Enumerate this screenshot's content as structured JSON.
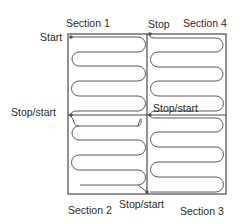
{
  "colors": {
    "outline": "#4a4a4a",
    "cable": "#5a5a5a",
    "dot": "#555555",
    "text": "#2b2b2b",
    "background": "#ffffff"
  },
  "labels": {
    "section1": "Section 1",
    "section2": "Section 2",
    "section3": "Section 3",
    "section4": "Section 4",
    "start": "Start",
    "stop": "Stop",
    "stop_start_left": "Stop/start",
    "stop_start_center": "Stop/start",
    "stop_start_bottom": "Stop/start"
  },
  "markers": [
    {
      "name": "start-point",
      "label": "Start"
    },
    {
      "name": "stop-point",
      "label": "Stop"
    },
    {
      "name": "left-middle-transition",
      "label": "Stop/start"
    },
    {
      "name": "center-transition",
      "label": "Stop/start"
    },
    {
      "name": "bottom-middle-transition",
      "label": "Stop/start"
    }
  ],
  "sections": [
    {
      "id": 1,
      "label": "Section 1",
      "position": "top-left",
      "runs": 6
    },
    {
      "id": 2,
      "label": "Section 2",
      "position": "bottom-left",
      "runs": 6
    },
    {
      "id": 3,
      "label": "Section 3",
      "position": "bottom-right",
      "runs": 6
    },
    {
      "id": 4,
      "label": "Section 4",
      "position": "top-right",
      "runs": 6
    }
  ]
}
